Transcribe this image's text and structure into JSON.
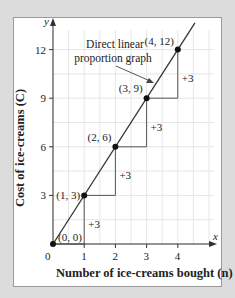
{
  "chart_data": {
    "type": "line",
    "title": "",
    "xlabel": "Number of ice-creams bought (n)",
    "ylabel": "Cost of ice-creams (C)",
    "x_axis_letter": "x",
    "y_axis_letter": "y",
    "x_ticks": [
      "0",
      "1",
      "2",
      "3",
      "4"
    ],
    "y_ticks": [
      "3",
      "6",
      "9",
      "12"
    ],
    "xlim": [
      0,
      4.6
    ],
    "ylim": [
      0,
      13
    ],
    "grid": true,
    "series": [
      {
        "name": "Direct linear proportion graph",
        "x": [
          0,
          1,
          2,
          3,
          4
        ],
        "y": [
          0,
          3,
          6,
          9,
          12
        ]
      }
    ],
    "point_labels": [
      "(0, 0)",
      "(1, 3)",
      "(2, 6)",
      "(3, 9)",
      "(4, 12)"
    ],
    "step_annotations": [
      "+3",
      "+3",
      "+3",
      "+3"
    ],
    "callout": {
      "line1": "Direct linear",
      "line2": "proportion graph"
    }
  },
  "labels": {
    "xlabel": "Number of ice-creams bought (n)",
    "ylabel": "Cost of ice-creams (C)"
  }
}
